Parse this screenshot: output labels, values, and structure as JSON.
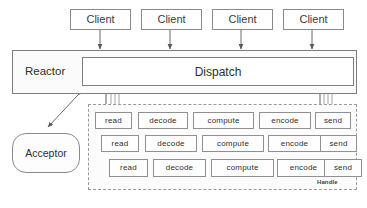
{
  "figure": {
    "title_fragment": "",
    "kind": "reactor-pattern-diagram",
    "colors": {
      "background": "#ffffff",
      "box_border": "#8d8d8d",
      "box_fill": "#fdfdfd",
      "arrow": "#555555",
      "dashed_border": "#9a9a9a",
      "text": "#2f2f2f"
    }
  },
  "clients": [
    {
      "label": "Client"
    },
    {
      "label": "Client"
    },
    {
      "label": "Client"
    },
    {
      "label": "Client"
    }
  ],
  "reactor": {
    "label": "Reactor"
  },
  "dispatch": {
    "label": "Dispatch"
  },
  "acceptor": {
    "label": "Acceptor"
  },
  "handle": {
    "label": "Handle",
    "rows": [
      {
        "stages": [
          "read",
          "decode",
          "compute",
          "encode",
          "send"
        ]
      },
      {
        "stages": [
          "read",
          "decode",
          "compute",
          "encode",
          "send"
        ]
      },
      {
        "stages": [
          "read",
          "decode",
          "compute",
          "encode",
          "send"
        ]
      }
    ]
  }
}
